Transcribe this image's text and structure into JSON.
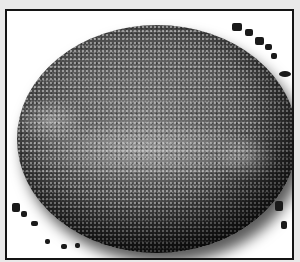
{
  "image": {
    "description": "Grayscale photograph of a large speckled spherical object (egg-like) inside a black rectangular frame on white background",
    "colors": {
      "frame": "#141414",
      "background": "#ffffff",
      "outer": "#e9e9e9",
      "sphere_mid": "#5a5a5a",
      "sphere_edge": "#111111"
    }
  }
}
